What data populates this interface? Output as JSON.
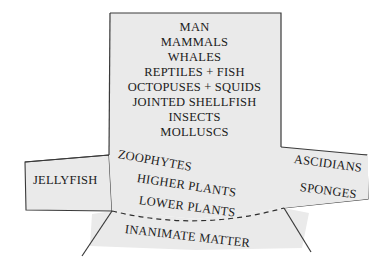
{
  "diagram": {
    "title_text": "",
    "background_color": "#ffffff",
    "shape_fill_color": "#eaeaea",
    "shape_stroke_color": "#3a3a3a",
    "text_color": "#1b1b1b",
    "column": {
      "labels": [
        "MAN",
        "MAMMALS",
        "WHALES",
        "REPTILES + FISH",
        "OCTOPUSES + SQUIDS",
        "JOINTED SHELLFISH",
        "INSECTS",
        "MOLLUSCS"
      ]
    },
    "fan": {
      "labels": [
        "ZOOPHYTES",
        "HIGHER PLANTS",
        "LOWER PLANTS"
      ]
    },
    "base": {
      "label": "INANIMATE MATTER"
    },
    "left_wing": {
      "label": "JELLYFISH"
    },
    "right_wing": {
      "labels": [
        "ASCIDIANS",
        "SPONGES"
      ]
    }
  }
}
